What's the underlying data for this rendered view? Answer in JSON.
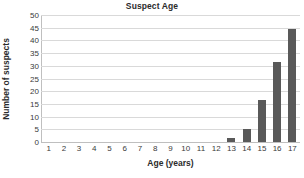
{
  "chart_data": {
    "type": "bar",
    "title": "Suspect Age",
    "xlabel": "Age (years)",
    "ylabel": "Number of suspects",
    "categories": [
      "1",
      "2",
      "3",
      "4",
      "5",
      "6",
      "7",
      "8",
      "9",
      "10",
      "11",
      "12",
      "13",
      "14",
      "15",
      "16",
      "17"
    ],
    "values": [
      0,
      0,
      0,
      0,
      0,
      0,
      0,
      0,
      0,
      0,
      0,
      0,
      1.5,
      5,
      16.5,
      31.5,
      44.5
    ],
    "ylim": [
      0,
      50
    ],
    "yticks": [
      "0",
      "5",
      "10",
      "15",
      "20",
      "25",
      "30",
      "35",
      "40",
      "45",
      "50"
    ],
    "ytick_values": [
      0,
      5,
      10,
      15,
      20,
      25,
      30,
      35,
      40,
      45,
      50
    ],
    "grid": true,
    "legend": "none",
    "bar_color": "#595959",
    "gridline_color": "#d9d9d9",
    "axis_color": "#bfbfbf",
    "text_color": "#2b2b2b",
    "background": "#ffffff"
  }
}
